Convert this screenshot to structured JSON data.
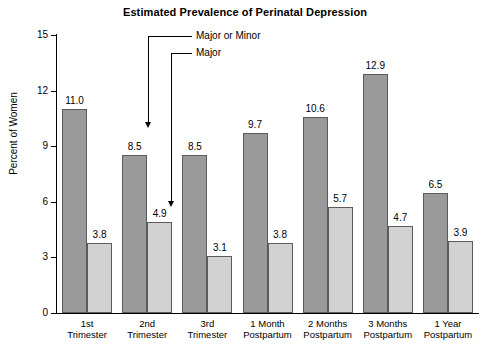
{
  "chart_data": {
    "type": "bar",
    "title": "Estimated Prevalence of Perinatal Depression",
    "xlabel": "",
    "ylabel": "Percent of Women",
    "ylim": [
      0,
      15
    ],
    "yticks": [
      0,
      3,
      6,
      9,
      12,
      15
    ],
    "ytick_labels": [
      "0",
      "3",
      "6",
      "9",
      "12",
      "15"
    ],
    "grid": false,
    "legend_position": "annotated-callouts",
    "categories": [
      "1st Trimester",
      "2nd Trimester",
      "3rd Trimester",
      "1 Month Postpartum",
      "2 Months Postpartum",
      "3 Months Postpartum",
      "1 Year Postpartum"
    ],
    "category_lines": [
      [
        "1st",
        "Trimester"
      ],
      [
        "2nd",
        "Trimester"
      ],
      [
        "3rd",
        "Trimester"
      ],
      [
        "1 Month",
        "Postpartum"
      ],
      [
        "2 Months",
        "Postpartum"
      ],
      [
        "3 Months",
        "Postpartum"
      ],
      [
        "1 Year",
        "Postpartum"
      ]
    ],
    "series": [
      {
        "name": "Major or Minor",
        "color": "#9a9a9a",
        "values": [
          11.0,
          8.5,
          8.5,
          9.7,
          10.6,
          12.9,
          6.5
        ],
        "labels": [
          "11.0",
          "8.5",
          "8.5",
          "9.7",
          "10.6",
          "12.9",
          "6.5"
        ]
      },
      {
        "name": "Major",
        "color": "#d2d2d2",
        "values": [
          3.8,
          4.9,
          3.1,
          3.8,
          5.7,
          4.7,
          3.9
        ],
        "labels": [
          "3.8",
          "4.9",
          "3.1",
          "3.8",
          "5.7",
          "4.7",
          "3.9"
        ]
      }
    ],
    "annotations": [
      {
        "text": "Major or Minor",
        "points_to_series": "Major or Minor",
        "points_to_category": "2nd Trimester"
      },
      {
        "text": "Major",
        "points_to_series": "Major",
        "points_to_category": "2nd Trimester"
      }
    ]
  }
}
